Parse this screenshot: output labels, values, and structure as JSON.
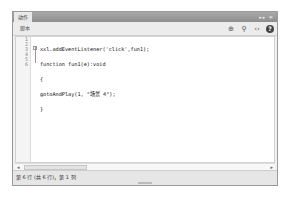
{
  "window": {
    "title": "动作",
    "controls": "▸▸ ≡"
  },
  "toolbar": {
    "script_tab": "脚本",
    "icons": [
      "target-icon",
      "search-icon",
      "code-snippet-icon",
      "help-icon"
    ],
    "icon_glyphs": [
      "⊕",
      "⚲",
      "‹›",
      "?"
    ]
  },
  "editor": {
    "line_numbers": [
      "1",
      "2",
      "3",
      "4",
      "5",
      "6"
    ],
    "lines": [
      "xxl.addEventListener('click',fun1);",
      "function fun1(e):void",
      "{",
      "gotoAndPlay(1, \"场景 4\");",
      "}",
      ""
    ]
  },
  "scrollbar": {
    "left_arrow": "◂",
    "right_arrow": "▸",
    "thumb_grip": "≡"
  },
  "status": {
    "text": "第 6 行 (共 6 行)，第 1 列"
  }
}
